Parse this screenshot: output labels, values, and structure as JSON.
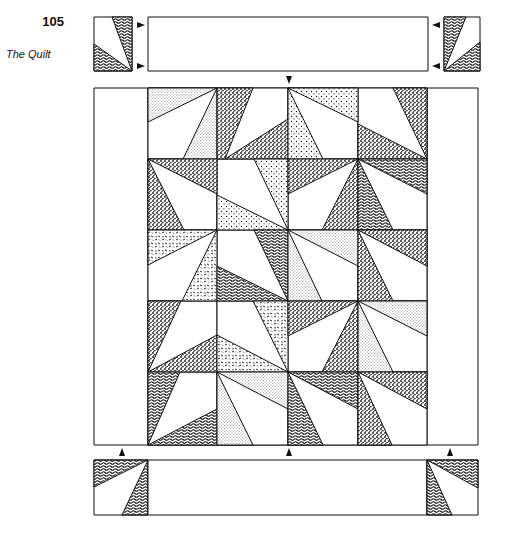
{
  "page": {
    "number": "105",
    "running_title": "The Quilt"
  },
  "diagram": {
    "grid": {
      "columns": 4,
      "rows": 5
    },
    "colors": {
      "line": "#111111",
      "background": "#ffffff"
    },
    "fills": [
      "dots",
      "speckle",
      "fine-stipple",
      "wavy-lines",
      "leafy"
    ]
  }
}
